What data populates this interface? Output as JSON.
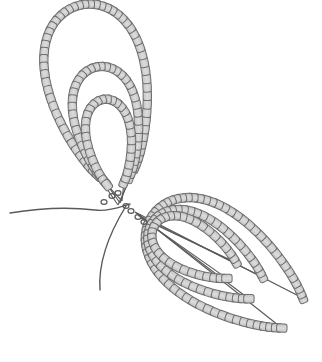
{
  "diagram": {
    "colors": {
      "bead_fill": "#c4c4c4",
      "bead_highlight": "#dcdcdc",
      "bead_stroke": "#6e6e6e",
      "thread": "#5a5a5a",
      "background": "#ffffff"
    },
    "loop_sets": [
      {
        "name": "upper-left-loops",
        "loops": [
          {
            "name": "outer",
            "bead_count": 58
          },
          {
            "name": "middle",
            "bead_count": 40
          },
          {
            "name": "inner",
            "bead_count": 30
          }
        ]
      },
      {
        "name": "lower-right-loops",
        "loops": [
          {
            "name": "outer",
            "bead_count": 62
          },
          {
            "name": "middle",
            "bead_count": 44
          },
          {
            "name": "inner",
            "bead_count": 32
          }
        ]
      }
    ],
    "thread_tails": 2
  }
}
